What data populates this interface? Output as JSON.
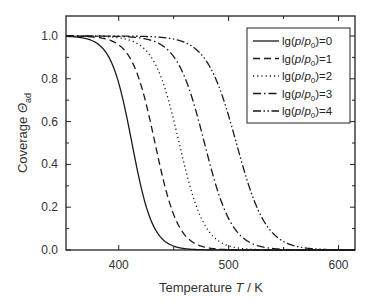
{
  "chart_data": {
    "type": "line",
    "title": "",
    "xlabel": "Temperature T / K",
    "xlabel_parts": {
      "pre": "Temperature ",
      "italic": "T",
      "post": " / K"
    },
    "ylabel": "Coverage Θ_ad",
    "ylabel_parts": {
      "pre": "Coverage ",
      "italic": "Θ",
      "sub": "ad"
    },
    "xlim": [
      352,
      615
    ],
    "ylim": [
      0.0,
      1.1
    ],
    "xticks": [
      400,
      500,
      600
    ],
    "xtick_labels": [
      "400",
      "500",
      "600"
    ],
    "xminor": [
      350,
      450,
      550
    ],
    "yticks": [
      0.0,
      0.2,
      0.4,
      0.6,
      0.8,
      1.0
    ],
    "ytick_labels": [
      "0.0",
      "0.2",
      "0.4",
      "0.6",
      "0.8",
      "1.0"
    ],
    "grid": false,
    "legend_position": "upper right",
    "series": [
      {
        "name": "lg(p/p0)=0",
        "legend": {
          "pre": "lg(",
          "p1": "p",
          "slash": "/",
          "p2": "p",
          "sub": "0",
          "post": ")=0"
        },
        "dash": "",
        "midpoint_T": 412,
        "width_K": 9.5
      },
      {
        "name": "lg(p/p0)=1",
        "legend": {
          "pre": "lg(",
          "p1": "p",
          "slash": "/",
          "p2": "p",
          "sub": "0",
          "post": ")=1"
        },
        "dash": "7,4",
        "midpoint_T": 433,
        "width_K": 10.5
      },
      {
        "name": "lg(p/p0)=2",
        "legend": {
          "pre": "lg(",
          "p1": "p",
          "slash": "/",
          "p2": "p",
          "sub": "0",
          "post": ")=2"
        },
        "dash": "1.2,3",
        "midpoint_T": 455,
        "width_K": 11.5
      },
      {
        "name": "lg(p/p0)=3",
        "legend": {
          "pre": "lg(",
          "p1": "p",
          "slash": "/",
          "p2": "p",
          "sub": "0",
          "post": ")=3"
        },
        "dash": "8,3,1.5,3",
        "midpoint_T": 478,
        "width_K": 12.5
      },
      {
        "name": "lg(p/p0)=4",
        "legend": {
          "pre": "lg(",
          "p1": "p",
          "slash": "/",
          "p2": "p",
          "sub": "0",
          "post": ")=4"
        },
        "dash": "8,2.5,1.5,2.5,1.5,2.5",
        "midpoint_T": 507,
        "width_K": 13.5
      }
    ],
    "x": [
      360,
      380,
      400,
      410,
      420,
      440,
      460,
      480,
      500,
      520,
      540,
      560,
      580,
      600
    ],
    "series_values": {
      "lg(p/p0)=0": [
        1.0,
        0.99,
        0.78,
        0.55,
        0.31,
        0.03,
        0.0,
        0.0,
        0.0,
        0.0,
        0.0,
        0.0,
        0.0,
        0.0
      ],
      "lg(p/p0)=1": [
        1.0,
        1.0,
        0.96,
        0.91,
        0.79,
        0.34,
        0.05,
        0.0,
        0.0,
        0.0,
        0.0,
        0.0,
        0.0,
        0.0
      ],
      "lg(p/p0)=2": [
        1.0,
        1.0,
        0.99,
        0.99,
        0.97,
        0.85,
        0.41,
        0.08,
        0.01,
        0.0,
        0.0,
        0.0,
        0.0,
        0.0
      ],
      "lg(p/p0)=3": [
        1.0,
        1.0,
        1.0,
        1.0,
        1.0,
        0.98,
        0.86,
        0.46,
        0.13,
        0.03,
        0.01,
        0.0,
        0.0,
        0.0
      ],
      "lg(p/p0)=4": [
        1.0,
        1.0,
        1.0,
        1.0,
        1.0,
        1.0,
        0.98,
        0.9,
        0.63,
        0.26,
        0.07,
        0.02,
        0.0,
        0.0
      ]
    }
  },
  "colors": {
    "line": "#1a1a1a",
    "axis": "#222222",
    "text": "#333333",
    "background": "#ffffff"
  }
}
